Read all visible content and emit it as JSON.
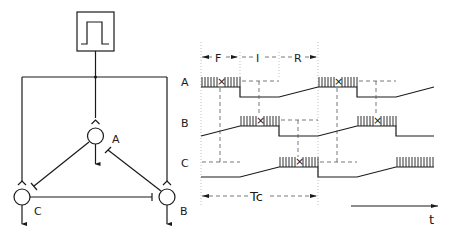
{
  "figure": {
    "circuit": {
      "oscillator": {
        "icon": "square-pulse-generator-icon"
      },
      "neurons": [
        {
          "id": "A",
          "label": "A"
        },
        {
          "id": "B",
          "label": "B"
        },
        {
          "id": "C",
          "label": "C"
        }
      ],
      "connections": [
        {
          "from": "pulse",
          "to": "A",
          "type": "excitatory"
        },
        {
          "from": "pulse",
          "to": "B",
          "type": "excitatory"
        },
        {
          "from": "pulse",
          "to": "C",
          "type": "excitatory"
        },
        {
          "from": "A",
          "to": "C",
          "type": "inhibitory"
        },
        {
          "from": "B",
          "to": "A",
          "type": "inhibitory"
        },
        {
          "from": "C",
          "to": "B",
          "type": "inhibitory"
        }
      ]
    },
    "timing": {
      "rows": [
        {
          "label": "A"
        },
        {
          "label": "B"
        },
        {
          "label": "C"
        }
      ],
      "phases": [
        {
          "label": "F"
        },
        {
          "label": "I"
        },
        {
          "label": "R"
        }
      ],
      "period_label": "Tc",
      "time_axis_label": "t",
      "burst_marker": "×"
    }
  }
}
